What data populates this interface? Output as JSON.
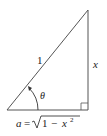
{
  "diagram": {
    "type": "right-triangle",
    "hypotenuse_label": "1",
    "opposite_label": "x",
    "angle_label": "θ",
    "adjacent_label": {
      "lhs": "a",
      "eq": "=",
      "radicand_one": "1",
      "minus": "−",
      "var": "x",
      "exp": "2"
    },
    "colors": {
      "stroke": "#555555",
      "text": "#222222"
    }
  }
}
